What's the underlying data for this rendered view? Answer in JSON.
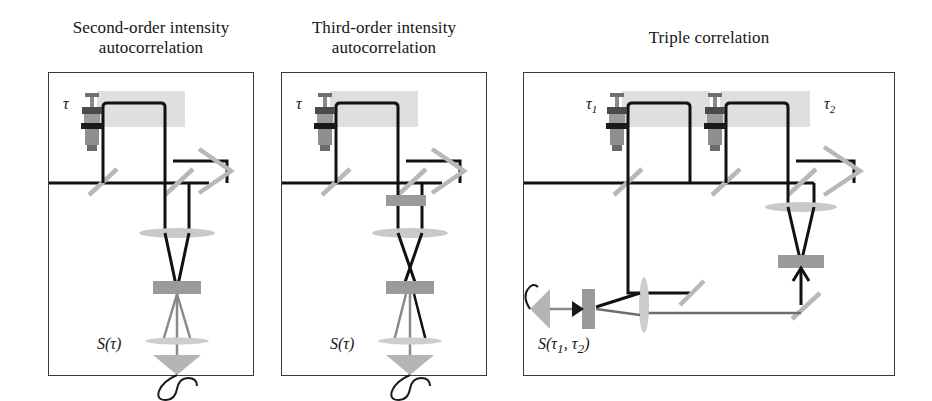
{
  "figure": {
    "caption_absent": true,
    "background": "#ffffff",
    "panel_border_color": "#3a3a3a",
    "beam_color_primary": "#111111",
    "beam_color_secondary": "#6e6e6e",
    "optic_gray": "#b8b8b8",
    "crystal_gray": "#9a9a9a",
    "highlight_gray": "#d6d6d6"
  },
  "panels": [
    {
      "id": "second-order",
      "title_line1": "Second-order intensity",
      "title_line2": "autocorrelation",
      "delay_labels": [
        "τ"
      ],
      "output_label": "S(τ)",
      "elements": [
        "input-beam",
        "beamsplitter",
        "delay-stage",
        "retroreflector",
        "focusing-lens",
        "nonlinear-crystal",
        "collection-lens",
        "detector"
      ]
    },
    {
      "id": "third-order",
      "title_line1": "Third-order intensity",
      "title_line2": "autocorrelation",
      "delay_labels": [
        "τ"
      ],
      "output_label": "S(τ)",
      "elements": [
        "input-beam",
        "beamsplitter",
        "delay-stage",
        "retroreflector",
        "first-crystal",
        "focusing-lens",
        "nonlinear-crystal",
        "collection-lens",
        "detector"
      ]
    },
    {
      "id": "triple-correlation",
      "title_line1": "Triple correlation",
      "title_line2": "",
      "delay_labels": [
        "τ",
        "τ"
      ],
      "delay_subscripts": [
        "1",
        "2"
      ],
      "output_label_main": "S(",
      "output_label_tau1": "τ",
      "output_label_sub1": "1",
      "output_label_comma": ", ",
      "output_label_tau2": "τ",
      "output_label_sub2": "2",
      "output_label_close": ")",
      "elements": [
        "input-beam",
        "beamsplitter-1",
        "delay-stage-1",
        "beamsplitter-2",
        "delay-stage-2",
        "retroreflector",
        "fold-mirror",
        "focusing-lens",
        "nonlinear-crystal",
        "collection-lens",
        "side-detector",
        "side-crystal"
      ]
    }
  ]
}
